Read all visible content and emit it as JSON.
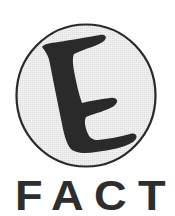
{
  "logo": {
    "emblem": {
      "letter": "E",
      "icon": "letter-e-in-circle-icon",
      "circle_fill": "#ececec",
      "circle_stroke": "#2a2a2a",
      "letter_color": "#2a2a2a"
    },
    "wordmark": {
      "text": "FACT",
      "letters": [
        "F",
        "A",
        "C",
        "T"
      ],
      "color": "#2e2e2e"
    }
  }
}
